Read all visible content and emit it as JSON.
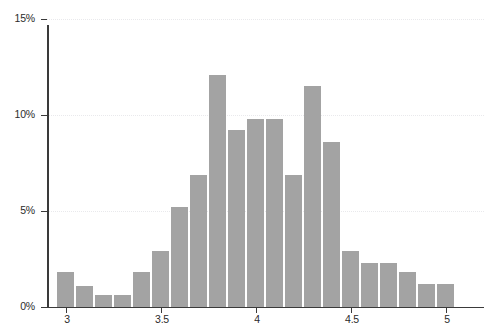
{
  "chart_data": {
    "type": "bar",
    "title": "",
    "xlabel": "",
    "ylabel": "",
    "xlim": [
      2.9,
      5.1
    ],
    "ylim": [
      0,
      15
    ],
    "grid": true,
    "legend": null,
    "bin_width": 0.1,
    "bar_color": "#a3a3a3",
    "axis_color": "#3a3a3a",
    "gridline_color": "#e9e9ec",
    "y_tick_labels": [
      "0%",
      "5%",
      "10%",
      "15%"
    ],
    "y_tick_values": [
      0,
      5,
      10,
      15
    ],
    "x_tick_labels": [
      "3",
      "3.5",
      "4",
      "4.5",
      "5"
    ],
    "x_tick_values": [
      3,
      3.5,
      4,
      4.5,
      5
    ],
    "categories": [
      "2.95-3.05",
      "3.05-3.15",
      "3.15-3.25",
      "3.25-3.35",
      "3.35-3.45",
      "3.45-3.55",
      "3.55-3.65",
      "3.65-3.75",
      "3.75-3.85",
      "3.85-3.95",
      "3.95-4.05",
      "4.05-4.15",
      "4.15-4.25",
      "4.25-4.35",
      "4.35-4.45",
      "4.45-4.55",
      "4.55-4.65",
      "4.65-4.75",
      "4.75-4.85",
      "4.85-4.95",
      "4.95-5.05"
    ],
    "bin_centers": [
      3.0,
      3.1,
      3.2,
      3.3,
      3.4,
      3.5,
      3.6,
      3.7,
      3.8,
      3.9,
      4.0,
      4.1,
      4.2,
      4.3,
      4.4,
      4.5,
      4.6,
      4.7,
      4.8,
      4.9,
      5.0
    ],
    "values": [
      1.8,
      1.1,
      0.6,
      0.6,
      1.8,
      2.9,
      5.2,
      6.9,
      12.1,
      9.2,
      9.8,
      9.8,
      6.9,
      11.5,
      8.6,
      2.9,
      2.3,
      2.3,
      1.8,
      1.2,
      1.2
    ]
  }
}
